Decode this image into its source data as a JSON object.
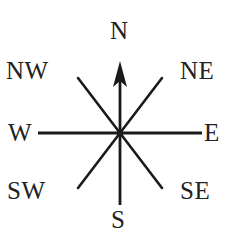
{
  "diagram": {
    "background_color": "#ffffff",
    "line_color": "#1a1a1a",
    "label_color": "#222222",
    "center": {
      "x": 120,
      "y": 133
    },
    "labels": {
      "north": "N",
      "northeast": "NE",
      "east": "E",
      "southeast": "SE",
      "south": "S",
      "southwest": "SW",
      "west": "W",
      "northwest": "NW"
    },
    "rays": [
      {
        "name": "north",
        "bearing_deg": 0,
        "has_arrowhead": true,
        "end_x": 120,
        "end_y": 62
      },
      {
        "name": "northeast",
        "bearing_deg": 45,
        "has_arrowhead": false,
        "end_x": 162,
        "end_y": 78
      },
      {
        "name": "east",
        "bearing_deg": 90,
        "has_arrowhead": false,
        "end_x": 202,
        "end_y": 133
      },
      {
        "name": "southeast",
        "bearing_deg": 135,
        "has_arrowhead": false,
        "end_x": 162,
        "end_y": 188
      },
      {
        "name": "south",
        "bearing_deg": 180,
        "has_arrowhead": false,
        "end_x": 120,
        "end_y": 205
      },
      {
        "name": "southwest",
        "bearing_deg": 225,
        "has_arrowhead": false,
        "end_x": 78,
        "end_y": 188
      },
      {
        "name": "west",
        "bearing_deg": 270,
        "has_arrowhead": false,
        "end_x": 38,
        "end_y": 133
      },
      {
        "name": "northwest",
        "bearing_deg": 315,
        "has_arrowhead": false,
        "end_x": 78,
        "end_y": 78
      }
    ]
  }
}
